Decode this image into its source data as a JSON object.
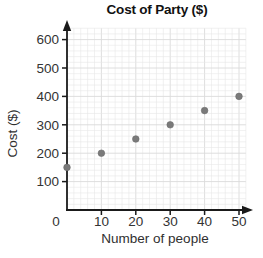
{
  "figure": {
    "title": "Cost of Party ($)",
    "xlabel": "Number of people",
    "ylabel": "Cost ($)"
  },
  "chart_data": {
    "type": "scatter",
    "title": "Cost of Party ($)",
    "xlabel": "Number of people",
    "ylabel": "Cost ($)",
    "points": [
      {
        "x": 0,
        "y": 150
      },
      {
        "x": 10,
        "y": 200
      },
      {
        "x": 20,
        "y": 250
      },
      {
        "x": 30,
        "y": 300
      },
      {
        "x": 40,
        "y": 350
      },
      {
        "x": 50,
        "y": 400
      }
    ],
    "x_ticks": [
      0,
      10,
      20,
      30,
      40,
      50
    ],
    "y_ticks": [
      100,
      200,
      300,
      400,
      500,
      600
    ],
    "xlim": [
      0,
      52
    ],
    "ylim": [
      0,
      640
    ],
    "grid": "minor",
    "legend": "none",
    "colors": {
      "point_fill": "#7a7a7a",
      "point_stroke": "#6b6b6b",
      "axis": "#1a1a1a",
      "tick_label": "#333333",
      "grid_minor": "#e7e7e7",
      "grid_major": "#dadada",
      "background": "#ffffff"
    }
  }
}
